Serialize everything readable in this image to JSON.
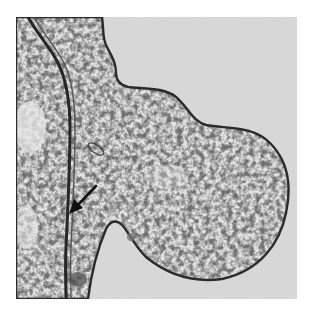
{
  "figure": {
    "annotation": {
      "type": "arrow",
      "direction": "down-left",
      "color": "#111111"
    },
    "caption": ""
  },
  "colors": {
    "background": "#d9d9d9",
    "cytoplasm_light": "#e3e3e3",
    "granule": "#3a3a3a",
    "membrane": "#2a2a2a",
    "page": "#ffffff"
  }
}
